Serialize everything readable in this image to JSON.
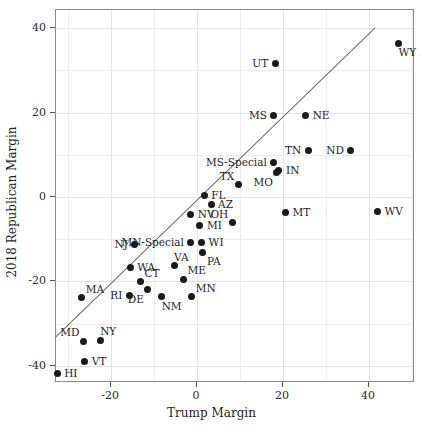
{
  "chart_data": {
    "type": "scatter",
    "title": "",
    "xlabel": "Trump Margin",
    "ylabel": "2018 Republican Margin",
    "xlim": [
      -32.8,
      50.7
    ],
    "ylim": [
      -44.1,
      44.3
    ],
    "xticks": [
      -20,
      0,
      20,
      40
    ],
    "xticklabels": [
      "-20",
      "0",
      "20",
      "40"
    ],
    "yticks": [
      -40,
      -20,
      0,
      20,
      40
    ],
    "yticklabels": [
      "-40",
      "-20",
      "0",
      "20",
      "40"
    ],
    "grid": true,
    "legend": "none",
    "annotations": [
      {
        "name": "identity-line",
        "type": "line",
        "note": "y = x reference line",
        "x0": -32.8,
        "y0": -33.4,
        "x1": 41.6,
        "y1": 40.0
      }
    ],
    "points": [
      {
        "label": "WY",
        "x": 47.1,
        "y": 36.2,
        "label_pos": "below"
      },
      {
        "label": "UT",
        "x": 18.4,
        "y": 31.4,
        "label_pos": "left"
      },
      {
        "label": "MS",
        "x": 18.1,
        "y": 19.0,
        "label_pos": "left"
      },
      {
        "label": "NE",
        "x": 25.5,
        "y": 19.0,
        "label_pos": "right"
      },
      {
        "label": "TN",
        "x": 26.1,
        "y": 10.7,
        "label_pos": "left"
      },
      {
        "label": "ND",
        "x": 36.0,
        "y": 10.7,
        "label_pos": "left"
      },
      {
        "label": "MS-Special",
        "x": 18.1,
        "y": 7.9,
        "label_pos": "left"
      },
      {
        "label": "IN",
        "x": 19.3,
        "y": 6.0,
        "label_pos": "right"
      },
      {
        "label": "MO",
        "x": 18.8,
        "y": 5.5,
        "label_pos": "below-left"
      },
      {
        "label": "TX",
        "x": 9.8,
        "y": 2.6,
        "label_pos": "above-left"
      },
      {
        "label": "FL",
        "x": 1.9,
        "y": 0.2,
        "label_pos": "right"
      },
      {
        "label": "AZ",
        "x": 3.5,
        "y": -2.1,
        "label_pos": "right"
      },
      {
        "label": "NV",
        "x": -1.2,
        "y": -4.5,
        "label_pos": "right"
      },
      {
        "label": "MT",
        "x": 20.8,
        "y": -3.9,
        "label_pos": "right"
      },
      {
        "label": "WV",
        "x": 42.2,
        "y": -3.6,
        "label_pos": "right"
      },
      {
        "label": "OH",
        "x": 8.4,
        "y": -6.4,
        "label_pos": "above-left"
      },
      {
        "label": "MI",
        "x": 0.9,
        "y": -6.9,
        "label_pos": "right"
      },
      {
        "label": "MN-Special",
        "x": -1.2,
        "y": -11.1,
        "label_pos": "left"
      },
      {
        "label": "NJ",
        "x": -14.2,
        "y": -11.6,
        "label_pos": "left"
      },
      {
        "label": "WI",
        "x": 1.3,
        "y": -11.1,
        "label_pos": "right"
      },
      {
        "label": "PA",
        "x": 1.6,
        "y": -13.3,
        "label_pos": "below-right"
      },
      {
        "label": "VA",
        "x": -5.1,
        "y": -16.5,
        "label_pos": "above"
      },
      {
        "label": "WA",
        "x": -15.3,
        "y": -16.9,
        "label_pos": "right"
      },
      {
        "label": "CT",
        "x": -12.9,
        "y": -20.3,
        "label_pos": "above-right"
      },
      {
        "label": "ME",
        "x": -2.9,
        "y": -19.7,
        "label_pos": "above-right"
      },
      {
        "label": "MA",
        "x": -26.6,
        "y": -24.1,
        "label_pos": "above-right"
      },
      {
        "label": "RI",
        "x": -15.5,
        "y": -23.5,
        "label_pos": "left"
      },
      {
        "label": "DE",
        "x": -11.2,
        "y": -22.2,
        "label_pos": "below-left"
      },
      {
        "label": "NM",
        "x": -8.0,
        "y": -23.9,
        "label_pos": "below"
      },
      {
        "label": "MN",
        "x": -1.0,
        "y": -23.9,
        "label_pos": "above-right"
      },
      {
        "label": "MD",
        "x": -26.2,
        "y": -34.4,
        "label_pos": "above-left"
      },
      {
        "label": "NY",
        "x": -22.3,
        "y": -34.2,
        "label_pos": "above"
      },
      {
        "label": "VT",
        "x": -25.9,
        "y": -39.3,
        "label_pos": "right"
      },
      {
        "label": "HI",
        "x": -32.3,
        "y": -42.0,
        "label_pos": "right"
      }
    ]
  }
}
